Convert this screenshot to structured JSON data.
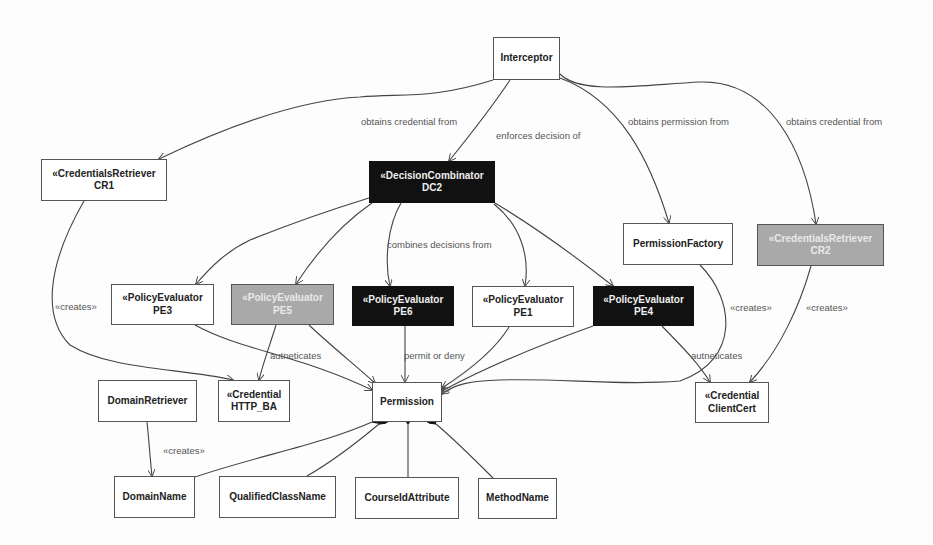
{
  "diagram": {
    "colors": {
      "white_fill": "#ffffff",
      "dark_fill": "#111111",
      "gray_fill": "#a9a9a9",
      "line": "#444444"
    },
    "nodes": [
      {
        "id": "interceptor",
        "line1": "Interceptor",
        "line2": "",
        "style": "white",
        "x": 493,
        "y": 37,
        "w": 67,
        "h": 43
      },
      {
        "id": "cr1",
        "line1": "«CredentialsRetriever",
        "line2": "CR1",
        "style": "white",
        "x": 41,
        "y": 159,
        "w": 126,
        "h": 42
      },
      {
        "id": "dc2",
        "line1": "«DecisionCombinator",
        "line2": "DC2",
        "style": "dark",
        "x": 369,
        "y": 161,
        "w": 126,
        "h": 42
      },
      {
        "id": "permissionfactory",
        "line1": "PermissionFactory",
        "line2": "",
        "style": "white",
        "x": 623,
        "y": 223,
        "w": 110,
        "h": 42
      },
      {
        "id": "cr2",
        "line1": "«CredentialsRetriever",
        "line2": "CR2",
        "style": "gray",
        "x": 757,
        "y": 224,
        "w": 127,
        "h": 42
      },
      {
        "id": "pe3",
        "line1": "«PolicyEvaluator",
        "line2": "PE3",
        "style": "white",
        "x": 111,
        "y": 284,
        "w": 103,
        "h": 41
      },
      {
        "id": "pe5",
        "line1": "«PolicyEvaluator",
        "line2": "PE5",
        "style": "gray",
        "x": 231,
        "y": 284,
        "w": 103,
        "h": 41
      },
      {
        "id": "pe6",
        "line1": "«PolicyEvaluator",
        "line2": "PE6",
        "style": "dark",
        "x": 352,
        "y": 286,
        "w": 102,
        "h": 40
      },
      {
        "id": "pe1",
        "line1": "«PolicyEvaluator",
        "line2": "PE1",
        "style": "white",
        "x": 472,
        "y": 286,
        "w": 102,
        "h": 41
      },
      {
        "id": "pe4",
        "line1": "«PolicyEvaluator",
        "line2": "PE4",
        "style": "dark",
        "x": 593,
        "y": 286,
        "w": 101,
        "h": 40
      },
      {
        "id": "domainretriever",
        "line1": "DomainRetriever",
        "line2": "",
        "style": "white",
        "x": 98,
        "y": 380,
        "w": 99,
        "h": 42
      },
      {
        "id": "httpba",
        "line1": "«Credential",
        "line2": "HTTP_BA",
        "style": "white",
        "x": 218,
        "y": 380,
        "w": 72,
        "h": 42
      },
      {
        "id": "permission",
        "line1": "Permission",
        "line2": "",
        "style": "white",
        "x": 372,
        "y": 382,
        "w": 70,
        "h": 40
      },
      {
        "id": "clientcert",
        "line1": "«Credential",
        "line2": "ClientCert",
        "style": "white",
        "x": 695,
        "y": 382,
        "w": 74,
        "h": 41
      },
      {
        "id": "domainname",
        "line1": "DomainName",
        "line2": "",
        "style": "white",
        "x": 114,
        "y": 476,
        "w": 81,
        "h": 42
      },
      {
        "id": "qualifiedclassname",
        "line1": "QualifiedClassName",
        "line2": "",
        "style": "white",
        "x": 219,
        "y": 476,
        "w": 117,
        "h": 42
      },
      {
        "id": "courseidattribute",
        "line1": "CourseIdAttribute",
        "line2": "",
        "style": "white",
        "x": 355,
        "y": 477,
        "w": 104,
        "h": 42
      },
      {
        "id": "methodname",
        "line1": "MethodName",
        "line2": "",
        "style": "white",
        "x": 478,
        "y": 478,
        "w": 79,
        "h": 41
      }
    ],
    "edge_labels": [
      {
        "id": "obtains-credential-from-cr1",
        "text": "obtains credential from",
        "x": 361,
        "y": 117
      },
      {
        "id": "enforces-decision-of",
        "text": "enforces decision of",
        "x": 496,
        "y": 131
      },
      {
        "id": "obtains-permission-from",
        "text": "obtains permission from",
        "x": 628,
        "y": 117
      },
      {
        "id": "obtains-credential-from-cr2",
        "text": "obtains credential from",
        "x": 786,
        "y": 117
      },
      {
        "id": "combines-decisions-from",
        "text": "combines decisions from",
        "x": 387,
        "y": 240
      },
      {
        "id": "creates-cr1-httpba",
        "text": "«creates»",
        "x": 55,
        "y": 302
      },
      {
        "id": "autneticates-pe5",
        "text": "autneticates",
        "x": 270,
        "y": 351
      },
      {
        "id": "permit-or-deny",
        "text": "permit or deny",
        "x": 404,
        "y": 351
      },
      {
        "id": "creates-pf-clientcert",
        "text": "«creates»",
        "x": 730,
        "y": 303
      },
      {
        "id": "creates-cr2-clientcert",
        "text": "«creates»",
        "x": 806,
        "y": 303
      },
      {
        "id": "autneticates-pe4",
        "text": "autneticates",
        "x": 691,
        "y": 351
      },
      {
        "id": "creates-dr-dn",
        "text": "«creates»",
        "x": 163,
        "y": 446
      }
    ]
  }
}
